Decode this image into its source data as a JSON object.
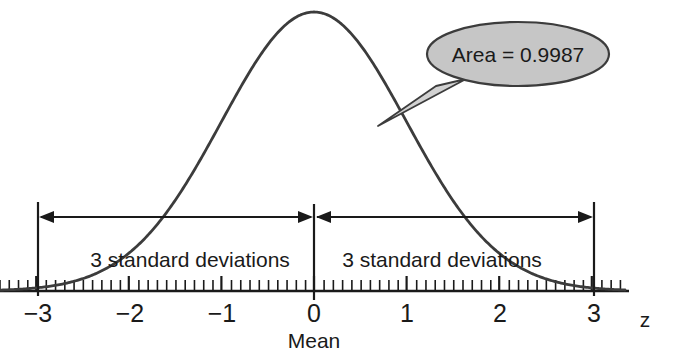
{
  "chart_data": {
    "type": "line",
    "title": "",
    "subtitle": "",
    "xlabel": "z",
    "ylabel": "",
    "x_axis_name": "z",
    "mean_label": "Mean",
    "grid": false,
    "legend_position": "none",
    "xlim": [
      -3.5,
      3.5
    ],
    "x_ticks": [
      -3,
      -2,
      -1,
      0,
      1,
      2,
      3
    ],
    "x_tick_labels": [
      "−3",
      "−2",
      "−1",
      "0",
      "1",
      "2",
      "3"
    ],
    "minor_tick_step": 0.1,
    "curve": "standard normal density (bell curve), mean 0, sd 1",
    "x": [
      -3.5,
      -3.0,
      -2.5,
      -2.0,
      -1.5,
      -1.0,
      -0.5,
      0.0,
      0.5,
      1.0,
      1.5,
      2.0,
      2.5,
      3.0,
      3.5
    ],
    "values": [
      0.0009,
      0.0044,
      0.0175,
      0.054,
      0.1295,
      0.242,
      0.3521,
      0.3989,
      0.3521,
      0.242,
      0.1295,
      0.054,
      0.0175,
      0.0044,
      0.0009
    ],
    "annotations": [
      {
        "name": "area-callout",
        "text": "Area = 0.9987",
        "value": 0.9987,
        "points_to_x": 0.65
      },
      {
        "name": "left-band",
        "text": "3 standard deviations",
        "from_x": -3,
        "to_x": 0
      },
      {
        "name": "right-band",
        "text": "3 standard deviations",
        "from_x": 0,
        "to_x": 3
      }
    ],
    "colors": {
      "curve": "#3c3c3c",
      "axis": "#1a1a1a",
      "callout_fill": "#c6c6c6",
      "callout_stroke": "#3c3c3c",
      "text": "#1a1a1a"
    }
  },
  "callout": {
    "label": "Area = 0.9987"
  },
  "bands": {
    "left_label": "3 standard deviations",
    "right_label": "3 standard deviations"
  },
  "axis": {
    "name": "z",
    "mean_label": "Mean",
    "ticks": [
      {
        "label": "−3",
        "x": 38
      },
      {
        "label": "−2",
        "x": 130
      },
      {
        "label": "−1",
        "x": 222
      },
      {
        "label": "0",
        "x": 314
      },
      {
        "label": "1",
        "x": 407
      },
      {
        "label": "2",
        "x": 500
      },
      {
        "label": "3",
        "x": 594
      }
    ]
  }
}
